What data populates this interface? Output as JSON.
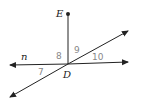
{
  "diagram": {
    "points": {
      "E": "E",
      "D": "D"
    },
    "line_label": "n",
    "angles": [
      "7",
      "8",
      "9",
      "10"
    ],
    "colors": {
      "lines": "#222222",
      "angle_labels": "#888888"
    }
  }
}
